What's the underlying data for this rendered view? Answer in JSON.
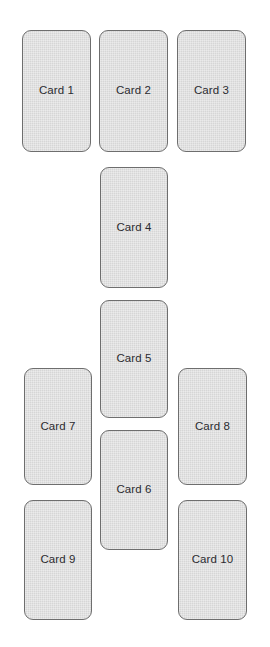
{
  "canvas": {
    "width": 270,
    "height": 647,
    "background_color": "#ffffff"
  },
  "style": {
    "card_fill": "#d6d6d6",
    "card_border_color": "#6e6e6e",
    "card_border_radius": 9,
    "label_color": "#2b2b30",
    "label_font_size": 11.5
  },
  "cards": [
    {
      "label": "Card 1",
      "x": 22,
      "y": 30,
      "w": 69,
      "h": 122
    },
    {
      "label": "Card 2",
      "x": 99,
      "y": 30,
      "w": 69,
      "h": 122
    },
    {
      "label": "Card 3",
      "x": 177,
      "y": 30,
      "w": 69,
      "h": 122
    },
    {
      "label": "Card 4",
      "x": 100,
      "y": 167,
      "w": 68,
      "h": 121
    },
    {
      "label": "Card 5",
      "x": 100,
      "y": 300,
      "w": 68,
      "h": 118
    },
    {
      "label": "Card 7",
      "x": 24,
      "y": 368,
      "w": 68,
      "h": 117
    },
    {
      "label": "Card 8",
      "x": 178,
      "y": 368,
      "w": 69,
      "h": 117
    },
    {
      "label": "Card 6",
      "x": 100,
      "y": 430,
      "w": 68,
      "h": 120
    },
    {
      "label": "Card 9",
      "x": 24,
      "y": 500,
      "w": 68,
      "h": 120
    },
    {
      "label": "Card 10",
      "x": 178,
      "y": 500,
      "w": 69,
      "h": 120
    }
  ]
}
